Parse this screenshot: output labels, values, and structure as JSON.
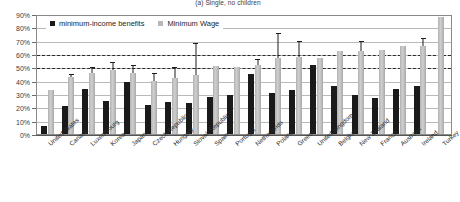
{
  "chart_data": {
    "type": "bar",
    "title": "(a) Single, no children",
    "xlabel": "",
    "ylabel": "",
    "ylim": [
      0,
      90
    ],
    "ytick_labels": [
      "0%",
      "10%",
      "20%",
      "30%",
      "40%",
      "50%",
      "60%",
      "70%",
      "80%",
      "90%"
    ],
    "ytick_values": [
      0,
      10,
      20,
      30,
      40,
      50,
      60,
      70,
      80,
      90
    ],
    "grid": true,
    "legend_position": "top-left",
    "reference_lines": [
      {
        "value": 60,
        "style": "dashed",
        "color": "#2a2a2a"
      },
      {
        "value": 50,
        "style": "dashed",
        "color": "#2a2a2a"
      }
    ],
    "categories": [
      "United States",
      "Canada",
      "Luxembourg",
      "Korea",
      "Japan",
      "Czech Republic",
      "Hungary",
      "Slovak Republic",
      "Spain",
      "Portugal",
      "Netherlands",
      "Poland",
      "Greece",
      "United Kingdom",
      "Belgium",
      "New Zealand",
      "France",
      "Australia",
      "Ireland",
      "Turkey"
    ],
    "series": [
      {
        "name": "minimum-income benefits",
        "color": "#1a1a1a",
        "values": [
          6,
          21,
          34,
          25,
          39,
          22,
          24,
          23,
          28,
          29,
          45,
          31,
          33,
          52,
          36,
          29,
          27,
          34,
          36,
          null
        ]
      },
      {
        "name": "Minimum Wage",
        "color": "#b8b8b8",
        "values": [
          33,
          43,
          46,
          48,
          46,
          40,
          42,
          44,
          51,
          50,
          52,
          57,
          58,
          57,
          62,
          62,
          63,
          66,
          66,
          88
        ],
        "error_high": [
          33,
          45,
          50,
          54,
          52,
          46,
          50,
          68,
          51,
          50,
          56,
          76,
          70,
          57,
          62,
          70,
          62,
          63,
          72,
          88
        ],
        "error_low": [
          33,
          43,
          46,
          48,
          46,
          40,
          42,
          44,
          51,
          50,
          52,
          57,
          58,
          57,
          62,
          62,
          63,
          66,
          66,
          88
        ]
      }
    ]
  },
  "legend": {
    "items": [
      {
        "label": "minimum-income benefits",
        "color": "#1a1a1a"
      },
      {
        "label": "Minimum Wage",
        "color": "#b8b8b8"
      }
    ]
  }
}
